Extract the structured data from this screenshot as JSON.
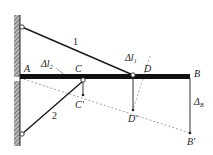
{
  "diagram": {
    "labels": {
      "bar1": "1",
      "bar2": "2",
      "A": "A",
      "B": "B",
      "C": "C",
      "D": "D",
      "C_prime": "C'",
      "D_prime": "D'",
      "B_prime": "B'",
      "delta_l1": "Δl",
      "delta_l1_sub": "1",
      "delta_l2": "Δl",
      "delta_l2_sub": "2",
      "delta_B": "Δ",
      "delta_B_sub": "B"
    },
    "colors": {
      "line": "#1a1a1a",
      "dashed": "#777777",
      "wall": "#555555"
    }
  }
}
